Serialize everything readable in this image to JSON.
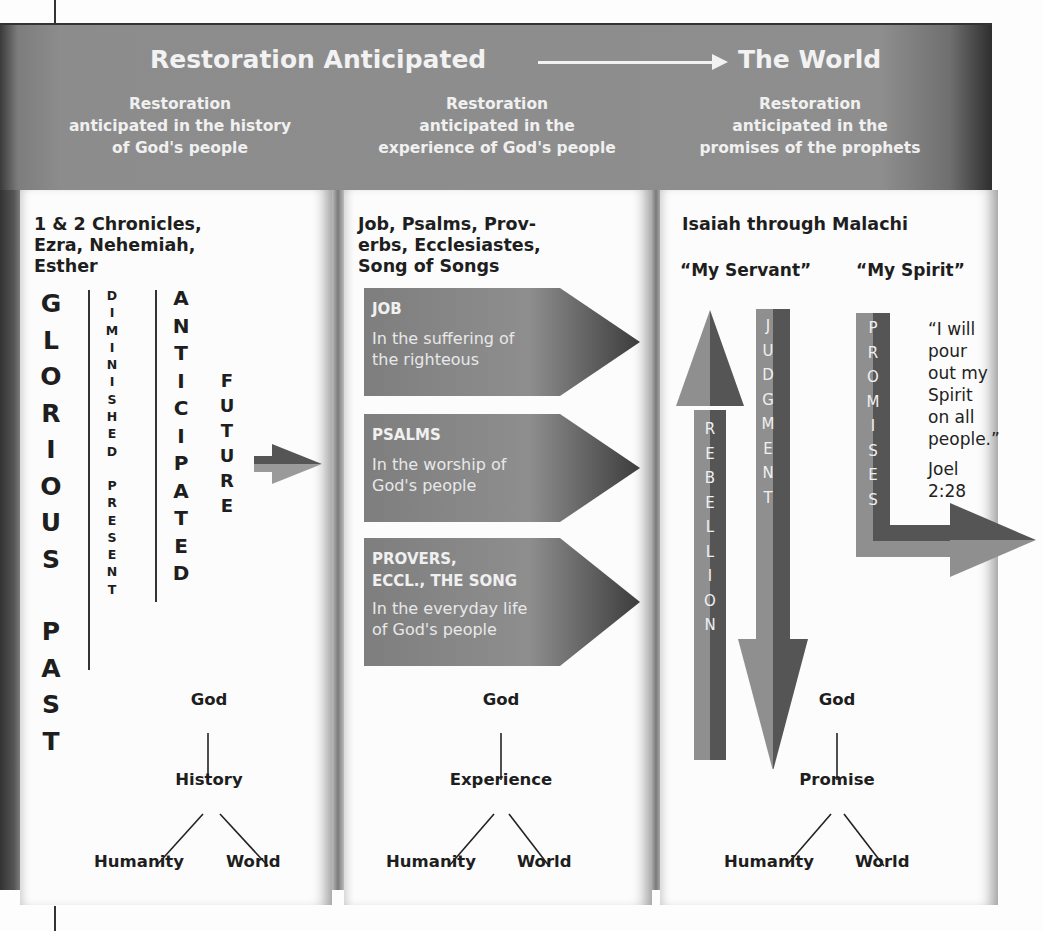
{
  "header": {
    "title_left": "Restoration Anticipated",
    "title_right": "The World",
    "arrow_icon": "long-right-arrow",
    "subtitles": [
      [
        "Restoration",
        "anticipated in the history",
        "of God's people"
      ],
      [
        "Restoration",
        "anticipated in the",
        "experience of God's people"
      ],
      [
        "Restoration",
        "anticipated in the",
        "promises of the prophets"
      ]
    ]
  },
  "columns": [
    {
      "title": [
        "1 & 2 Chronicles,",
        "Ezra, Nehemiah,",
        "Esther"
      ],
      "vertical_words": {
        "glorious_past": "GLORIOUS PAST",
        "diminished_present": "DIMINISHED PRESENT",
        "anticipated": "ANTICIPATED",
        "future": "FUTURE"
      },
      "tree": {
        "top": "God",
        "middle": "History",
        "left": "Humanity",
        "right": "World"
      }
    },
    {
      "title": [
        "Job, Psalms, Prov-",
        "erbs, Ecclesiastes,",
        "Song of Songs"
      ],
      "books": [
        {
          "label": "JOB",
          "desc": [
            "In the suffering of",
            "the righteous"
          ]
        },
        {
          "label": "PSALMS",
          "desc": [
            "In the worship of",
            "God's people"
          ]
        },
        {
          "label": "PROVERS,\nECCL., THE SONG",
          "label_lines": [
            "PROVERS,",
            "ECCL., THE SONG"
          ],
          "desc": [
            "In the everyday life",
            "of God's people"
          ]
        }
      ],
      "tree": {
        "top": "God",
        "middle": "Experience",
        "left": "Humanity",
        "right": "World"
      }
    },
    {
      "title": [
        "Isaiah through Malachi"
      ],
      "subheads": [
        "“My Servant”",
        "“My Spirit”"
      ],
      "arrows": {
        "rebellion": "REBELLION",
        "judgment": "JUDGMENT",
        "promises": "PROMISES"
      },
      "quote": [
        "“I will",
        "pour",
        "out my",
        "Spirit",
        "on all",
        "people.”"
      ],
      "reference": [
        "Joel",
        "2:28"
      ],
      "tree": {
        "top": "God",
        "middle": "Promise",
        "left": "Humanity",
        "right": "World"
      }
    }
  ],
  "colors": {
    "header_gray": "#8c8c8c",
    "arrow_light": "#8f8f8f",
    "arrow_dark": "#555555",
    "card_bg": "#fcfcfc",
    "text_dark": "#1e1e1e",
    "text_light": "#f2f2f2"
  }
}
